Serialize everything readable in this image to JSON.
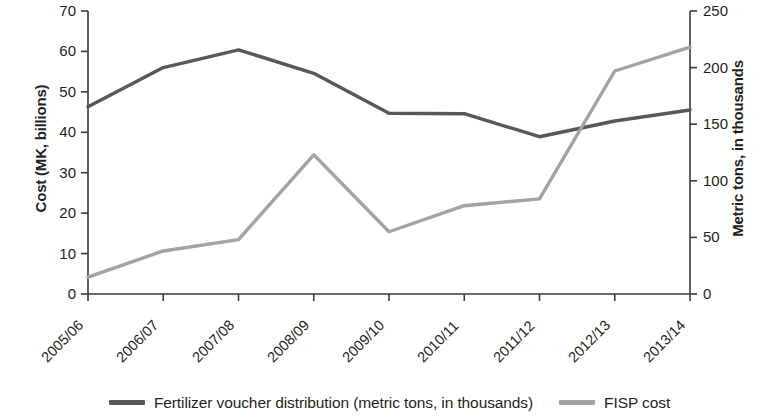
{
  "chart_data": {
    "type": "line",
    "title": "",
    "xlabel": "",
    "categories": [
      "2005/06",
      "2006/07",
      "2007/08",
      "2008/09",
      "2009/10",
      "2010/11",
      "2011/12",
      "2012/13",
      "2013/14"
    ],
    "grid": false,
    "legend_position": "bottom",
    "axes": {
      "left": {
        "label": "Cost (MK, billions)",
        "ticks": [
          0,
          10,
          20,
          30,
          40,
          50,
          60,
          70
        ],
        "lim": [
          0,
          70
        ]
      },
      "right": {
        "label": "Metric tons, in thousands",
        "ticks": [
          0,
          50,
          100,
          150,
          200,
          250
        ],
        "lim": [
          0,
          250
        ]
      }
    },
    "series": [
      {
        "name": "Fertilizer voucher distribution (metric tons, in thousands)",
        "axis": "left",
        "color": "#58585a",
        "values": [
          46.3,
          56.0,
          60.4,
          54.6,
          44.7,
          44.6,
          38.9,
          42.8,
          45.5
        ]
      },
      {
        "name": "FISP cost",
        "axis": "right",
        "color": "#a3a3a3",
        "values": [
          15,
          38,
          48,
          123,
          55,
          78,
          84,
          197,
          218
        ]
      }
    ]
  },
  "legend": {
    "items": [
      {
        "label": "Fertilizer voucher distribution (metric tons, in thousands)",
        "color": "#58585a"
      },
      {
        "label": "FISP cost",
        "color": "#a3a3a3"
      }
    ]
  }
}
